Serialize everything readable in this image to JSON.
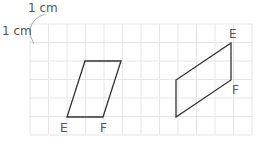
{
  "scale_label_top": "1 cm",
  "scale_label_left": "1 cm",
  "grid": {
    "x0": 30,
    "y0": 24,
    "cell": 18.5,
    "cols": 12,
    "rows": 6,
    "line_color": "#e6e6e6"
  },
  "shapes": [
    {
      "name": "left-parallelogram",
      "points": "85,61 121,61 103,117 67,117",
      "labels": [
        {
          "text": "E",
          "x": 60,
          "y": 132
        },
        {
          "text": "F",
          "x": 100,
          "y": 132
        }
      ]
    },
    {
      "name": "right-parallelogram",
      "points": "231,43 231,80 176,117 176,80",
      "labels": [
        {
          "text": "E",
          "x": 229,
          "y": 38
        },
        {
          "text": "F",
          "x": 232,
          "y": 94
        }
      ]
    }
  ],
  "stroke_color": "#333333"
}
